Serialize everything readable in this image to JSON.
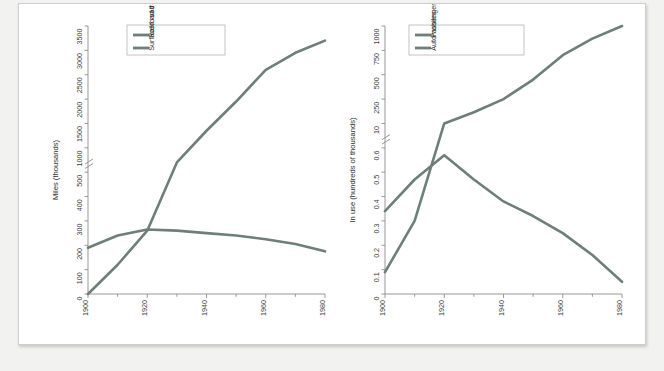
{
  "page": {
    "background_color": "#ffffff",
    "canvas_color": "#f2f2f1",
    "series_color": "#6d7f78",
    "axis_color": "#8d8d8d",
    "text_color": "#3d3d3d"
  },
  "chart_data": [
    {
      "type": "line",
      "id": "left-chart",
      "title": "",
      "xlabel": "",
      "ylabel": "Miles (thousands)",
      "x": [
        1900,
        1910,
        1920,
        1930,
        1940,
        1950,
        1960,
        1970,
        1980
      ],
      "xlim": [
        1900,
        1980
      ],
      "x_ticks_major": [
        1900,
        1920,
        1940,
        1960,
        1980
      ],
      "x_tick_labels": [
        "1900",
        "1920",
        "1940",
        "1960",
        "1980"
      ],
      "x_ticks_minor": [
        1910,
        1930,
        1950,
        1970
      ],
      "y_tick_labels": [
        "0",
        "100",
        "200",
        "300",
        "400",
        "500",
        "1000",
        "1500",
        "2000",
        "2500",
        "3000",
        "3500"
      ],
      "y_values": [
        0,
        100,
        200,
        300,
        400,
        500,
        1000,
        1500,
        2000,
        2500,
        3000,
        3500
      ],
      "axis_break": true,
      "axis_break_between": [
        500,
        1000
      ],
      "grid": false,
      "legend_position": "top-left",
      "series": [
        {
          "name": "Railroad track",
          "color": "#6d7f78",
          "values": [
            190,
            240,
            265,
            260,
            250,
            240,
            225,
            205,
            175
          ]
        },
        {
          "name": "Surfaced road",
          "color": "#6d7f78",
          "values": [
            0,
            120,
            260,
            700,
            1350,
            1950,
            2600,
            2950,
            3200
          ]
        }
      ]
    },
    {
      "type": "line",
      "id": "right-chart",
      "title": "",
      "xlabel": "",
      "ylabel": "In use (hundreds of thousands)",
      "x": [
        1900,
        1910,
        1920,
        1930,
        1940,
        1950,
        1960,
        1970,
        1980
      ],
      "xlim": [
        1900,
        1980
      ],
      "x_ticks_major": [
        1900,
        1920,
        1940,
        1960,
        1980
      ],
      "x_tick_labels": [
        "1900",
        "1920",
        "1940",
        "1960",
        "1980"
      ],
      "x_ticks_minor": [
        1910,
        1930,
        1950,
        1970
      ],
      "y_tick_labels": [
        "0",
        "0.1",
        "0.2",
        "0.3",
        "0.4",
        "0.5",
        "0.6",
        "10",
        "250",
        "500",
        "750",
        "1000"
      ],
      "y_values": [
        0,
        0.1,
        0.2,
        0.3,
        0.4,
        0.5,
        0.6,
        10,
        250,
        500,
        750,
        1000
      ],
      "axis_break": true,
      "axis_break_between": [
        0.6,
        10
      ],
      "grid": false,
      "legend_position": "top-left",
      "series": [
        {
          "name": "Passenger train cars",
          "color": "#6d7f78",
          "values": [
            0.34,
            0.47,
            0.57,
            0.47,
            0.38,
            0.32,
            0.25,
            0.16,
            0.05
          ]
        },
        {
          "name": "Automobiles",
          "color": "#6d7f78",
          "values": [
            0.09,
            0.3,
            10,
            120,
            250,
            450,
            700,
            870,
            1030
          ]
        }
      ]
    }
  ]
}
